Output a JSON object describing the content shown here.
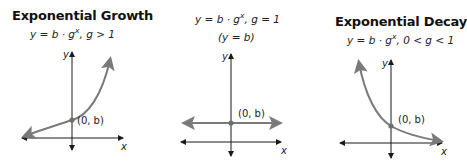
{
  "panels": [
    {
      "id": "growth",
      "title": "Exponential Growth",
      "formula": {
        "lhs": "y = b · g",
        "exponent": "x",
        "condition": ",  g > 1"
      },
      "note": "",
      "point_label": "(0, b)",
      "axis_x_label": "x",
      "axis_y_label": "y"
    },
    {
      "id": "constant",
      "title": "",
      "formula": {
        "lhs": "y = b · g",
        "exponent": "x",
        "condition": ",  g = 1"
      },
      "note": "(y = b)",
      "point_label": "(0, b)",
      "axis_x_label": "x",
      "axis_y_label": "y"
    },
    {
      "id": "decay",
      "title": "Exponential Decay",
      "formula": {
        "lhs": "y = b · g",
        "exponent": "x",
        "condition": ",  0 < g < 1"
      },
      "note": "",
      "point_label": "(0, b)",
      "axis_x_label": "x",
      "axis_y_label": "y"
    }
  ],
  "colors": {
    "axis": "#1a1a1a",
    "curve": "#7a7a7a",
    "point": "#6e6e6e",
    "text": "#1a1a1a"
  }
}
